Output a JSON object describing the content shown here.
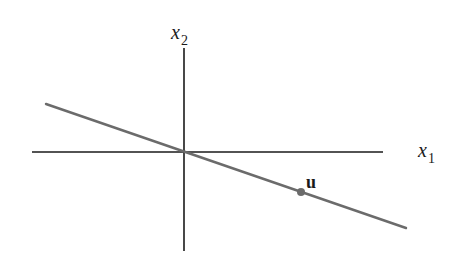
{
  "diagram": {
    "axes": {
      "x_axis": {
        "label": "x",
        "subscript": "1"
      },
      "y_axis": {
        "label": "x",
        "subscript": "2"
      }
    },
    "line": {
      "description": "line through the origin with negative slope",
      "color": "#6b6b6b"
    },
    "point": {
      "label": "u",
      "color": "#6b6b6b"
    },
    "colors": {
      "axis": "#1a1a1a",
      "line": "#6b6b6b",
      "point": "#6b6b6b"
    }
  }
}
